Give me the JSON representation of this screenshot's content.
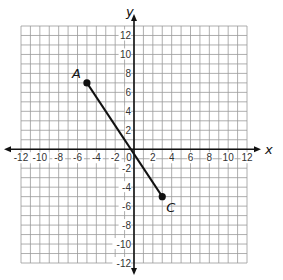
{
  "chart_data": {
    "type": "scatter",
    "title": "",
    "xlabel": "x",
    "ylabel": "y",
    "xlim": [
      -12,
      12
    ],
    "ylim": [
      -12,
      13
    ],
    "grid": true,
    "x_ticks": [
      -12,
      -10,
      -8,
      -6,
      -4,
      -2,
      0,
      2,
      4,
      6,
      8,
      10,
      12
    ],
    "y_ticks": [
      -12,
      -10,
      -8,
      -6,
      -4,
      -2,
      2,
      4,
      6,
      8,
      10,
      12
    ],
    "points": [
      {
        "label": "A",
        "x": -5,
        "y": 7
      },
      {
        "label": "C",
        "x": 3,
        "y": -5
      }
    ],
    "segments": [
      {
        "from": "A",
        "to": "C"
      }
    ]
  },
  "colors": {
    "grid": "#9a9a9a",
    "axis": "#111111",
    "segment": "#111111"
  }
}
